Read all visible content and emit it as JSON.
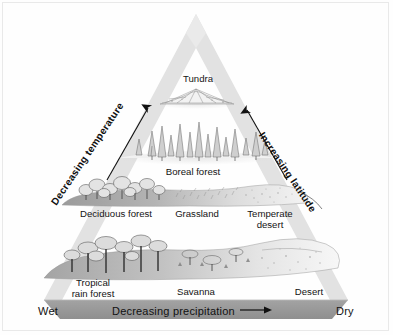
{
  "diagram": {
    "type": "biome-distribution-pyramid",
    "background_color": "#ffffff",
    "pyramid_edge_color": "#e2e2e2",
    "base_bar_color": "#9a9a9a",
    "axes": {
      "left_edge": {
        "label": "Decreasing temperature",
        "direction": "up",
        "arrow": "upward"
      },
      "right_edge": {
        "label": "Increasing latitude",
        "direction": "up",
        "arrow": "upward"
      },
      "base": {
        "label": "Decreasing precipitation",
        "direction": "left-to-right",
        "arrow": "rightward",
        "left_end_label": "Wet",
        "right_end_label": "Dry"
      }
    },
    "bands": [
      {
        "row": 1,
        "position": "apex",
        "biomes": [
          {
            "name": "Tundra",
            "lines": [
              "Tundra"
            ],
            "vegetation": "low-mound-sparse"
          }
        ]
      },
      {
        "row": 2,
        "position": "upper-middle",
        "biomes": [
          {
            "name": "Boreal forest",
            "lines": [
              "Boreal forest"
            ],
            "vegetation": "conifers"
          }
        ]
      },
      {
        "row": 3,
        "position": "lower-middle",
        "biomes": [
          {
            "name": "Deciduous forest",
            "lines": [
              "Deciduous forest"
            ],
            "vegetation": "broadleaf-trees"
          },
          {
            "name": "Grassland",
            "lines": [
              "Grassland"
            ],
            "vegetation": "grass-stipple"
          },
          {
            "name": "Temperate desert",
            "lines": [
              "Temperate",
              "desert"
            ],
            "vegetation": "sparse-stipple"
          }
        ]
      },
      {
        "row": 4,
        "position": "base",
        "biomes": [
          {
            "name": "Tropical rain forest",
            "lines": [
              "Tropical",
              "rain forest"
            ],
            "vegetation": "tall-canopy"
          },
          {
            "name": "Savanna",
            "lines": [
              "Savanna"
            ],
            "vegetation": "scattered-acacia"
          },
          {
            "name": "Desert",
            "lines": [
              "Desert"
            ],
            "vegetation": "bare-sand"
          }
        ]
      }
    ],
    "labels": {
      "tundra": "Tundra",
      "boreal_forest": "Boreal forest",
      "deciduous_forest": "Deciduous forest",
      "grassland": "Grassland",
      "temperate_desert": "Temperate\ndesert",
      "tropical_rain_forest": "Tropical\nrain forest",
      "savanna": "Savanna",
      "desert": "Desert",
      "decreasing_temperature": "Decreasing temperature",
      "increasing_latitude": "Increasing latitude",
      "decreasing_precipitation": "Decreasing precipitation",
      "wet": "Wet",
      "dry": "Dry"
    }
  }
}
